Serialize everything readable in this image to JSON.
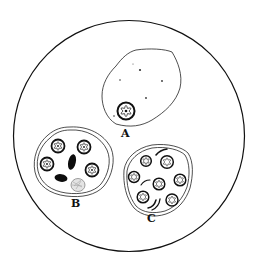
{
  "diagram": {
    "colors": {
      "ink": "#111111",
      "stipple": "#cfcfcf",
      "hatch_fill": "#e4e4e4",
      "background": "#ffffff"
    },
    "cells": [
      {
        "id": "A",
        "label": "A",
        "nuclei_count": 1,
        "membrane": "single",
        "granules": 6
      },
      {
        "id": "B",
        "label": "B",
        "nuclei_count": 4,
        "membrane": "double",
        "dark_bodies": 2,
        "shaded_body": 1
      },
      {
        "id": "C",
        "label": "C",
        "nuclei_count": 7,
        "membrane": "double",
        "crescent_bodies": 4
      }
    ]
  }
}
